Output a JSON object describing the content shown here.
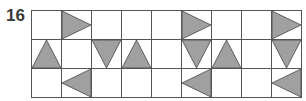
{
  "puzzle_number": "16",
  "grid": {
    "rows": 3,
    "cols": 9,
    "fill_color": "#a0a0a0",
    "stroke_color": "#444444",
    "cells": [
      [
        "",
        "right",
        "",
        "",
        "",
        "right",
        "",
        "",
        "right"
      ],
      [
        "up",
        "",
        "down",
        "up",
        "",
        "down",
        "up",
        "",
        "down"
      ],
      [
        "",
        "left",
        "",
        "",
        "",
        "left",
        "",
        "",
        "left"
      ]
    ]
  }
}
